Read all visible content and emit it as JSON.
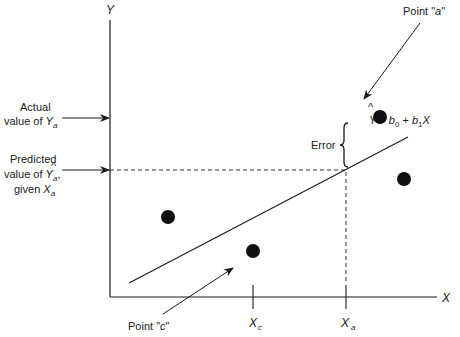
{
  "diagram": {
    "type": "regression-error-diagram",
    "axes": {
      "y_label": "Y",
      "x_label": "X"
    },
    "x_ticks": [
      {
        "label_main": "X",
        "label_sub": "c"
      },
      {
        "label_main": "X",
        "label_sub": "a"
      }
    ],
    "equation": {
      "lhs": "Y",
      "hat": "^",
      "equals": "= ",
      "b0": "b",
      "b0_sub": "0",
      "plus": " + ",
      "b1": "b",
      "b1_sub": "1",
      "x": "X"
    },
    "annotations": {
      "point_a": {
        "prefix": "Point \"",
        "var": "a",
        "suffix": "\""
      },
      "point_c": {
        "prefix": "Point \"",
        "var": "c",
        "suffix": "\""
      },
      "error": "Error",
      "actual_line1": "Actual",
      "actual_line2_prefix": "value of ",
      "actual_var": "Y",
      "actual_sub": "a",
      "predicted_line1": "Predicted",
      "predicted_line2_prefix": "value of ",
      "predicted_var": "Y",
      "predicted_hat": "^",
      "predicted_sub": "a",
      "predicted_comma": ",",
      "predicted_line3_prefix": "given ",
      "predicted_given_var": "X",
      "predicted_given_sub": "a"
    },
    "data_points": [
      {
        "name": "point-a",
        "label": "a"
      },
      {
        "name": "point-right",
        "label": ""
      },
      {
        "name": "point-left",
        "label": ""
      },
      {
        "name": "point-c",
        "label": "c"
      }
    ],
    "colors": {
      "ink": "#1a1a1a",
      "background": "#ffffff"
    }
  }
}
